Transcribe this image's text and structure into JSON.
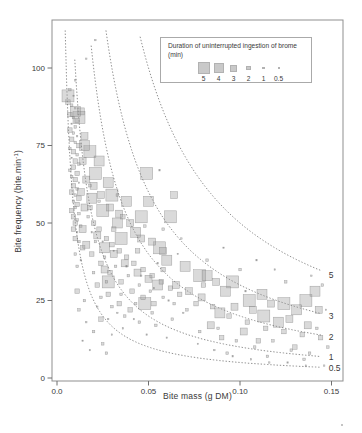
{
  "figure": {
    "background": "#ffffff"
  },
  "axes": {
    "x": {
      "label": "Bite mass (g DM)",
      "ticks": [
        {
          "v": 0,
          "label": "0.0"
        },
        {
          "v": 0.05,
          "label": "0.05"
        },
        {
          "v": 0.1,
          "label": "0.10"
        },
        {
          "v": 0.15,
          "label": "0.15"
        }
      ]
    },
    "y": {
      "label_prefix": "Bite frequency (bite.min",
      "label_sup": "-1",
      "label_suffix": ")",
      "ticks": [
        {
          "v": 0,
          "label": "0"
        },
        {
          "v": 25,
          "label": "25"
        },
        {
          "v": 50,
          "label": "50"
        },
        {
          "v": 75,
          "label": "75"
        },
        {
          "v": 100,
          "label": "100"
        }
      ]
    }
  },
  "legend": {
    "title": "Duration of uninterrupted ingestion of brome (min)",
    "items": [
      {
        "label": "5",
        "size_px": 12
      },
      {
        "label": "4",
        "size_px": 10
      },
      {
        "label": "3",
        "size_px": 7
      },
      {
        "label": "2",
        "size_px": 4.5
      },
      {
        "label": "1",
        "size_px": 2.5
      },
      {
        "label": "0.5",
        "size_px": 1.4
      }
    ]
  },
  "colors": {
    "frame": "#8f8f8f",
    "tick": "#6f6f6f",
    "text": "#3a3a3a",
    "curve": "#909090",
    "point_fill": "rgba(158,158,158,0.38)",
    "point_stroke": "rgba(102,102,102,0.55)",
    "legend_square": "#c9c9c9"
  },
  "chart_data": {
    "type": "scatter",
    "title": "",
    "xlabel": "Bite mass (g DM)",
    "ylabel": "Bite frequency (bite.min-1)",
    "xlim": [
      0,
      0.155
    ],
    "ylim": [
      0,
      115
    ],
    "grid": false,
    "legend_position": "top-right-inside",
    "marker": "square",
    "size_encoding": "Duration of uninterrupted ingestion of brome (min)",
    "size_classes_min": [
      5,
      4,
      3,
      2,
      1,
      0.5
    ],
    "size_px_by_class": {
      "5": 12,
      "4": 10,
      "3": 7,
      "2": 4.5,
      "1": 2.5,
      "0.5": 1.4
    },
    "isolines": {
      "equation": "y = c / x",
      "constants": [
        5,
        3,
        2,
        1,
        0.5
      ],
      "labels": [
        "5",
        "3",
        "2",
        "1",
        "0.5"
      ],
      "style": "dotted"
    },
    "points_format": [
      "bite_mass_gDM",
      "bite_frequency_per_min",
      "duration_min"
    ],
    "points": [
      [
        0.007,
        93,
        1
      ],
      [
        0.009,
        91,
        0.5
      ],
      [
        0.006,
        89,
        2
      ],
      [
        0.008,
        88,
        1
      ],
      [
        0.01,
        87,
        0.5
      ],
      [
        0.007,
        85,
        2
      ],
      [
        0.009,
        84,
        1
      ],
      [
        0.011,
        83,
        2
      ],
      [
        0.008,
        82,
        0.5
      ],
      [
        0.01,
        81,
        1
      ],
      [
        0.007,
        80,
        2
      ],
      [
        0.009,
        79,
        1
      ],
      [
        0.011,
        78,
        0.5
      ],
      [
        0.008,
        77,
        2
      ],
      [
        0.01,
        76,
        1
      ],
      [
        0.012,
        75,
        2
      ],
      [
        0.007,
        74,
        1
      ],
      [
        0.009,
        73,
        2
      ],
      [
        0.011,
        72,
        1
      ],
      [
        0.008,
        71,
        0.5
      ],
      [
        0.01,
        70,
        2
      ],
      [
        0.012,
        69,
        1
      ],
      [
        0.009,
        68,
        2
      ],
      [
        0.007,
        67,
        1
      ],
      [
        0.011,
        66,
        2
      ],
      [
        0.008,
        65,
        1
      ],
      [
        0.01,
        64,
        2
      ],
      [
        0.012,
        63,
        0.5
      ],
      [
        0.009,
        62,
        2
      ],
      [
        0.011,
        61,
        1
      ],
      [
        0.008,
        60,
        2
      ],
      [
        0.01,
        59,
        1
      ],
      [
        0.012,
        58,
        2
      ],
      [
        0.009,
        57,
        1
      ],
      [
        0.011,
        56,
        2
      ],
      [
        0.01,
        55,
        1
      ],
      [
        0.008,
        54,
        2
      ],
      [
        0.012,
        53,
        1
      ],
      [
        0.009,
        52,
        2
      ],
      [
        0.011,
        51,
        1
      ],
      [
        0.01,
        50,
        2
      ],
      [
        0.013,
        49,
        1
      ],
      [
        0.009,
        48,
        2
      ],
      [
        0.011,
        47,
        0.5
      ],
      [
        0.01,
        45,
        2
      ],
      [
        0.012,
        44,
        1
      ],
      [
        0.014,
        42,
        2
      ],
      [
        0.01,
        40,
        1
      ],
      [
        0.013,
        38,
        0.5
      ],
      [
        0.011,
        36,
        1
      ],
      [
        0.013,
        86,
        3
      ],
      [
        0.015,
        78,
        3
      ],
      [
        0.014,
        70,
        3
      ],
      [
        0.016,
        64,
        3
      ],
      [
        0.013,
        60,
        3
      ],
      [
        0.015,
        55,
        3
      ],
      [
        0.014,
        48,
        3
      ],
      [
        0.016,
        43,
        3
      ],
      [
        0.006,
        91,
        5
      ],
      [
        0.012,
        84,
        5
      ],
      [
        0.018,
        73,
        5
      ],
      [
        0.021,
        66,
        5
      ],
      [
        0.049,
        66,
        5
      ],
      [
        0.03,
        59,
        5
      ],
      [
        0.025,
        54,
        5
      ],
      [
        0.046,
        52,
        5
      ],
      [
        0.062,
        52,
        5
      ],
      [
        0.035,
        45,
        5
      ],
      [
        0.056,
        42,
        5
      ],
      [
        0.028,
        31,
        5
      ],
      [
        0.048,
        24,
        5
      ],
      [
        0.078,
        33,
        5
      ],
      [
        0.096,
        31,
        5
      ],
      [
        0.105,
        25,
        5
      ],
      [
        0.124,
        24,
        5
      ],
      [
        0.136,
        25,
        5
      ],
      [
        0.113,
        20,
        5
      ],
      [
        0.01,
        86,
        4
      ],
      [
        0.015,
        75,
        4
      ],
      [
        0.023,
        70,
        4
      ],
      [
        0.028,
        63,
        4
      ],
      [
        0.038,
        57,
        4
      ],
      [
        0.05,
        57,
        4
      ],
      [
        0.033,
        50,
        4
      ],
      [
        0.043,
        47,
        4
      ],
      [
        0.019,
        58,
        4
      ],
      [
        0.026,
        42,
        4
      ],
      [
        0.06,
        38,
        4
      ],
      [
        0.07,
        36,
        4
      ],
      [
        0.055,
        30,
        4
      ],
      [
        0.082,
        33,
        4
      ],
      [
        0.092,
        28,
        4
      ],
      [
        0.112,
        27,
        4
      ],
      [
        0.131,
        22,
        4
      ],
      [
        0.121,
        18,
        4
      ],
      [
        0.089,
        21,
        4
      ],
      [
        0.141,
        28,
        4
      ],
      [
        0.02,
        62,
        3
      ],
      [
        0.024,
        59,
        3
      ],
      [
        0.029,
        55,
        3
      ],
      [
        0.034,
        53,
        3
      ],
      [
        0.04,
        50,
        3
      ],
      [
        0.046,
        45,
        3
      ],
      [
        0.052,
        44,
        3
      ],
      [
        0.058,
        41,
        3
      ],
      [
        0.031,
        40,
        3
      ],
      [
        0.037,
        37,
        3
      ],
      [
        0.044,
        34,
        3
      ],
      [
        0.05,
        32,
        3
      ],
      [
        0.065,
        30,
        3
      ],
      [
        0.072,
        28,
        3
      ],
      [
        0.026,
        35,
        3
      ],
      [
        0.022,
        46,
        3
      ],
      [
        0.064,
        59,
        3
      ],
      [
        0.079,
        26,
        3
      ],
      [
        0.087,
        31,
        3
      ],
      [
        0.097,
        23,
        3
      ],
      [
        0.107,
        22,
        3
      ],
      [
        0.117,
        24,
        3
      ],
      [
        0.127,
        19,
        3
      ],
      [
        0.137,
        17,
        3
      ],
      [
        0.084,
        17,
        3
      ],
      [
        0.102,
        15,
        3
      ],
      [
        0.143,
        22,
        3
      ],
      [
        0.018,
        55,
        2
      ],
      [
        0.02,
        50,
        2
      ],
      [
        0.023,
        48,
        2
      ],
      [
        0.027,
        45,
        2
      ],
      [
        0.03,
        43,
        2
      ],
      [
        0.034,
        41,
        2
      ],
      [
        0.038,
        39,
        2
      ],
      [
        0.042,
        37,
        2
      ],
      [
        0.047,
        35,
        2
      ],
      [
        0.052,
        33,
        2
      ],
      [
        0.057,
        31,
        2
      ],
      [
        0.062,
        29,
        2
      ],
      [
        0.067,
        27,
        2
      ],
      [
        0.019,
        40,
        2
      ],
      [
        0.024,
        37,
        2
      ],
      [
        0.029,
        34,
        2
      ],
      [
        0.035,
        31,
        2
      ],
      [
        0.041,
        28,
        2
      ],
      [
        0.047,
        26,
        2
      ],
      [
        0.053,
        24,
        2
      ],
      [
        0.022,
        30,
        2
      ],
      [
        0.028,
        27,
        2
      ],
      [
        0.034,
        24,
        2
      ],
      [
        0.04,
        22,
        2
      ],
      [
        0.031,
        48,
        2
      ],
      [
        0.036,
        52,
        2
      ],
      [
        0.044,
        41,
        2
      ],
      [
        0.058,
        35,
        2
      ],
      [
        0.076,
        24,
        2
      ],
      [
        0.085,
        23,
        2
      ],
      [
        0.094,
        20,
        2
      ],
      [
        0.104,
        18,
        2
      ],
      [
        0.114,
        16,
        2
      ],
      [
        0.124,
        15,
        2
      ],
      [
        0.134,
        14,
        2
      ],
      [
        0.144,
        13,
        2
      ],
      [
        0.09,
        13,
        2
      ],
      [
        0.11,
        12,
        2
      ],
      [
        0.13,
        10,
        2
      ],
      [
        0.08,
        30,
        2
      ],
      [
        0.017,
        52,
        1
      ],
      [
        0.021,
        44,
        1
      ],
      [
        0.026,
        39,
        1
      ],
      [
        0.032,
        36,
        1
      ],
      [
        0.039,
        33,
        1
      ],
      [
        0.045,
        30,
        1
      ],
      [
        0.051,
        28,
        1
      ],
      [
        0.058,
        26,
        1
      ],
      [
        0.064,
        24,
        1
      ],
      [
        0.071,
        22,
        1
      ],
      [
        0.024,
        26,
        1
      ],
      [
        0.03,
        23,
        1
      ],
      [
        0.037,
        20,
        1
      ],
      [
        0.045,
        18,
        1
      ],
      [
        0.054,
        17,
        1
      ],
      [
        0.02,
        34,
        1
      ],
      [
        0.027,
        31,
        1
      ],
      [
        0.035,
        27,
        1
      ],
      [
        0.043,
        24,
        1
      ],
      [
        0.052,
        21,
        1
      ],
      [
        0.063,
        19,
        1
      ],
      [
        0.018,
        62,
        1
      ],
      [
        0.023,
        57,
        1
      ],
      [
        0.033,
        59,
        1
      ],
      [
        0.048,
        49,
        1
      ],
      [
        0.078,
        15,
        1
      ],
      [
        0.088,
        16,
        1
      ],
      [
        0.098,
        12,
        1
      ],
      [
        0.108,
        10,
        1
      ],
      [
        0.118,
        12,
        1
      ],
      [
        0.128,
        9,
        1
      ],
      [
        0.138,
        8,
        1
      ],
      [
        0.148,
        10,
        1
      ],
      [
        0.093,
        8,
        1
      ],
      [
        0.115,
        7,
        1
      ],
      [
        0.135,
        6,
        1
      ],
      [
        0.082,
        38,
        1
      ],
      [
        0.1,
        35,
        1
      ],
      [
        0.125,
        31,
        1
      ],
      [
        0.145,
        30,
        1
      ],
      [
        0.142,
        16,
        1
      ],
      [
        0.019,
        47,
        0.5
      ],
      [
        0.025,
        44,
        0.5
      ],
      [
        0.031,
        41,
        0.5
      ],
      [
        0.038,
        36,
        0.5
      ],
      [
        0.046,
        33,
        0.5
      ],
      [
        0.053,
        29,
        0.5
      ],
      [
        0.061,
        25,
        0.5
      ],
      [
        0.069,
        21,
        0.5
      ],
      [
        0.028,
        19,
        0.5
      ],
      [
        0.036,
        16,
        0.5
      ],
      [
        0.049,
        14,
        0.5
      ],
      [
        0.06,
        13,
        0.5
      ],
      [
        0.022,
        23,
        0.5
      ],
      [
        0.033,
        21,
        0.5
      ],
      [
        0.042,
        19,
        0.5
      ],
      [
        0.055,
        37,
        0.5
      ],
      [
        0.066,
        40,
        0.5
      ],
      [
        0.021,
        109,
        0.5
      ],
      [
        0.016,
        103,
        0.5
      ],
      [
        0.077,
        11,
        0.5
      ],
      [
        0.086,
        9,
        0.5
      ],
      [
        0.096,
        7,
        0.5
      ],
      [
        0.106,
        6,
        0.5
      ],
      [
        0.116,
        5,
        0.5
      ],
      [
        0.126,
        5,
        0.5
      ],
      [
        0.136,
        4,
        0.5
      ],
      [
        0.146,
        4,
        0.5
      ],
      [
        0.091,
        42,
        0.5
      ],
      [
        0.109,
        38,
        0.5
      ],
      [
        0.119,
        35,
        0.5
      ],
      [
        0.139,
        33,
        0.5
      ],
      [
        0.147,
        22,
        0.5
      ],
      [
        0.103,
        28,
        0.5
      ],
      [
        0.012,
        22,
        1
      ],
      [
        0.016,
        18,
        0.5
      ],
      [
        0.02,
        15,
        1
      ],
      [
        0.014,
        12,
        0.5
      ],
      [
        0.025,
        11,
        1
      ],
      [
        0.018,
        9,
        0.5
      ],
      [
        0.011,
        28,
        2
      ],
      [
        0.015,
        25,
        1
      ],
      [
        0.03,
        14,
        0.5
      ],
      [
        0.024,
        19,
        2
      ],
      [
        0.027,
        8,
        1
      ],
      [
        0.01,
        96,
        0.5
      ],
      [
        0.056,
        67,
        0.5
      ],
      [
        0.058,
        48,
        1
      ],
      [
        0.068,
        45,
        0.5
      ]
    ]
  }
}
